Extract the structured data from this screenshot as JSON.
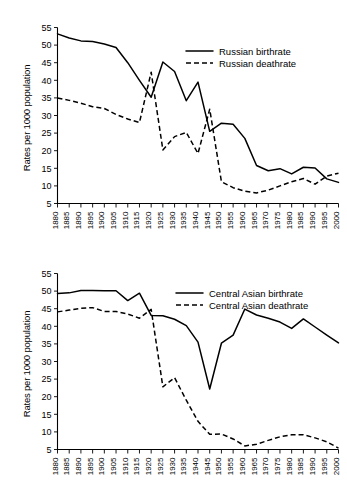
{
  "figure": {
    "background_color": "#ffffff",
    "line_color": "#000000"
  },
  "chart_data": [
    {
      "id": "russia",
      "type": "line",
      "title": "",
      "xlabel": "",
      "ylabel": "Rates per 1000 population",
      "xlim": [
        1880,
        2000
      ],
      "ylim": [
        5,
        55
      ],
      "yticks": [
        5,
        10,
        15,
        20,
        25,
        30,
        35,
        40,
        45,
        50,
        55
      ],
      "grid": false,
      "legend_position": "top-right",
      "x": [
        1880,
        1885,
        1890,
        1895,
        1900,
        1905,
        1910,
        1915,
        1920,
        1925,
        1930,
        1935,
        1940,
        1945,
        1950,
        1955,
        1960,
        1965,
        1970,
        1975,
        1980,
        1985,
        1990,
        1995,
        2000
      ],
      "series": [
        {
          "name": "Russian birthrate",
          "style": "solid",
          "values": [
            53.2,
            52.0,
            51.2,
            51.0,
            50.3,
            49.3,
            45.0,
            40.0,
            35.2,
            45.2,
            42.5,
            34.2,
            39.5,
            25.5,
            27.8,
            27.5,
            23.5,
            15.8,
            14.3,
            14.9,
            13.4,
            15.3,
            15.1,
            12.0,
            11.0
          ]
        },
        {
          "name": "Russian deathrate",
          "style": "dashed",
          "values": [
            35.0,
            34.3,
            33.5,
            32.5,
            32.0,
            30.3,
            29.0,
            28.0,
            42.3,
            20.2,
            24.0,
            25.2,
            19.2,
            31.8,
            11.2,
            9.5,
            8.5,
            8.0,
            8.8,
            10.0,
            11.2,
            12.1,
            10.5,
            12.8,
            13.6
          ]
        }
      ]
    },
    {
      "id": "central-asia",
      "type": "line",
      "title": "",
      "xlabel": "",
      "ylabel": "Rates per 1000 population",
      "xlim": [
        1880,
        2000
      ],
      "ylim": [
        5,
        55
      ],
      "yticks": [
        5,
        10,
        15,
        20,
        25,
        30,
        35,
        40,
        45,
        50,
        55
      ],
      "grid": false,
      "legend_position": "top-right",
      "x": [
        1880,
        1885,
        1890,
        1895,
        1900,
        1905,
        1910,
        1915,
        1920,
        1925,
        1930,
        1935,
        1940,
        1945,
        1950,
        1955,
        1960,
        1965,
        1970,
        1975,
        1980,
        1985,
        1990,
        1995,
        2000
      ],
      "series": [
        {
          "name": "Central Asian birthrate",
          "style": "solid",
          "values": [
            49.3,
            49.5,
            50.2,
            50.2,
            50.1,
            50.1,
            47.3,
            49.4,
            43.1,
            43.0,
            42.0,
            40.2,
            35.5,
            22.2,
            35.2,
            37.5,
            44.9,
            43.2,
            42.3,
            41.2,
            39.4,
            42.1,
            39.8,
            37.5,
            35.3
          ]
        },
        {
          "name": "Central Asian deathrate",
          "style": "dashed",
          "values": [
            44.1,
            44.6,
            45.1,
            45.3,
            44.2,
            44.2,
            43.5,
            42.3,
            44.8,
            22.8,
            25.4,
            19.0,
            13.0,
            9.3,
            9.4,
            8.0,
            6.0,
            6.5,
            7.6,
            8.6,
            9.2,
            9.2,
            8.3,
            7.2,
            5.4
          ]
        }
      ]
    }
  ],
  "charts": [
    {
      "ylabel": "Rates per 1000 population",
      "ytick_labels": [
        "55",
        "50",
        "45",
        "40",
        "35",
        "30",
        "25",
        "20",
        "15",
        "10",
        "5"
      ],
      "xtick_labels": [
        "1880",
        "1885",
        "1890",
        "1895",
        "1900",
        "1905",
        "1910",
        "1915",
        "1920",
        "1925",
        "1930",
        "1935",
        "1940",
        "1945",
        "1950",
        "1955",
        "1960",
        "1965",
        "1970",
        "1975",
        "1980",
        "1985",
        "1990",
        "1995",
        "2000"
      ],
      "legend": [
        {
          "label": "Russian birthrate",
          "style": "solid"
        },
        {
          "label": "Russian deathrate",
          "style": "dashed"
        }
      ]
    },
    {
      "ylabel": "Rates per 1000 population",
      "ytick_labels": [
        "55",
        "50",
        "45",
        "40",
        "35",
        "30",
        "25",
        "20",
        "15",
        "10",
        "5"
      ],
      "xtick_labels": [
        "1880",
        "1885",
        "1890",
        "1895",
        "1900",
        "1905",
        "1910",
        "1915",
        "1920",
        "1925",
        "1930",
        "1935",
        "1940",
        "1945",
        "1950",
        "1955",
        "1960",
        "1965",
        "1970",
        "1975",
        "1980",
        "1985",
        "1990",
        "1995",
        "2000"
      ],
      "legend": [
        {
          "label": "Central Asian birthrate",
          "style": "solid"
        },
        {
          "label": "Central Asian deathrate",
          "style": "dashed"
        }
      ]
    }
  ]
}
